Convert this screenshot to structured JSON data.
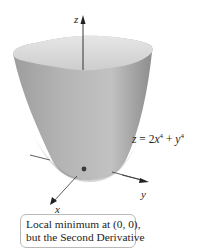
{
  "figure": {
    "surface": {
      "equation_lhs": "z",
      "equation_text": "z = 2x⁴ + y⁴",
      "coef_x": "2",
      "var_x": "x",
      "exp_x": "4",
      "var_y": "y",
      "exp_y": "4",
      "fill_light": "#d9d9d9",
      "fill_mid": "#a9a9a9",
      "fill_dark": "#8a8a8a"
    },
    "axes": {
      "z_label": "z",
      "y_label": "y",
      "x_label": "x"
    },
    "minimum_point": {
      "label": "(0, 0)",
      "color": "#3a3a3a"
    },
    "callout": {
      "line1": "Local minimum at (0, 0),",
      "line2": "but the Second Derivative"
    }
  }
}
